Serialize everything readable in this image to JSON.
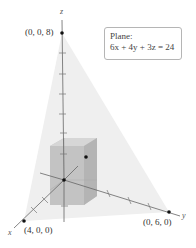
{
  "figure": {
    "axes": {
      "x_label": "x",
      "y_label": "y",
      "z_label": "z"
    },
    "points": [
      {
        "label": "(0, 0, 8)",
        "coords": [
          0,
          0,
          8
        ]
      },
      {
        "label": "(4, 0, 0)",
        "coords": [
          4,
          0,
          0
        ]
      },
      {
        "label": "(0, 6, 0)",
        "coords": [
          0,
          6,
          0
        ]
      }
    ],
    "plane_box": {
      "title": "Plane:",
      "equation": "6x + 4y + 3z = 24"
    },
    "colors": {
      "axis": "#666666",
      "box_fill": "#bdbdbd",
      "plane_fill": "#ececec",
      "point": "#111111"
    }
  }
}
